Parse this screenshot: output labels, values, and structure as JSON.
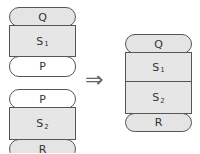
{
  "left_top_stack": {
    "top": {
      "label": "Q",
      "fill": "#e4e4e4"
    },
    "middle": {
      "label": "S",
      "sub": "1",
      "fill": "#e6e6e6"
    },
    "bottom": {
      "label": "P",
      "fill": "#ffffff"
    }
  },
  "left_bottom_stack": {
    "top": {
      "label": "P",
      "fill": "#ffffff"
    },
    "middle": {
      "label": "S",
      "sub": "2",
      "fill": "#e6e6e6"
    },
    "bottom": {
      "label": "R",
      "fill": "#e4e4e4"
    }
  },
  "arrow": {
    "symbol": "⇒"
  },
  "right_stack": {
    "top": {
      "label": "Q"
    },
    "middle1": {
      "label": "S",
      "sub": "1"
    },
    "middle2": {
      "label": "S",
      "sub": "2"
    },
    "bottom": {
      "label": "R"
    }
  }
}
